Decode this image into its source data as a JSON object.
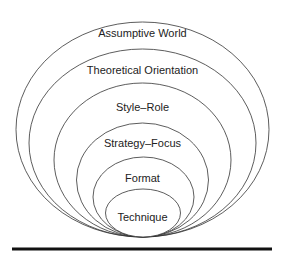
{
  "diagram": {
    "type": "nested-ellipses",
    "layers": [
      {
        "label": "Assumptive World",
        "cx": 142.5,
        "cy": 129.5,
        "rx": 126.5,
        "ry": 107.5,
        "label_y": 27
      },
      {
        "label": "Theoretical Orientation",
        "cx": 142.5,
        "cy": 143,
        "rx": 113.5,
        "ry": 94,
        "label_y": 64
      },
      {
        "label": "Style–Role",
        "cx": 142.5,
        "cy": 160,
        "rx": 88.5,
        "ry": 77,
        "label_y": 101
      },
      {
        "label": "Strategy–Focus",
        "cx": 142.5,
        "cy": 180,
        "rx": 66,
        "ry": 57,
        "label_y": 137
      },
      {
        "label": "Format",
        "cx": 143.5,
        "cy": 197,
        "rx": 50.5,
        "ry": 40,
        "label_y": 172
      },
      {
        "label": "Technique",
        "cx": 143,
        "cy": 213,
        "rx": 37.5,
        "ry": 24,
        "label_y": 212
      }
    ],
    "baseline": {
      "x1": 12,
      "x2": 272,
      "y": 249,
      "thickness": 3
    },
    "colors": {
      "stroke": "#333333",
      "text": "#222222",
      "baseline": "#111111"
    }
  }
}
